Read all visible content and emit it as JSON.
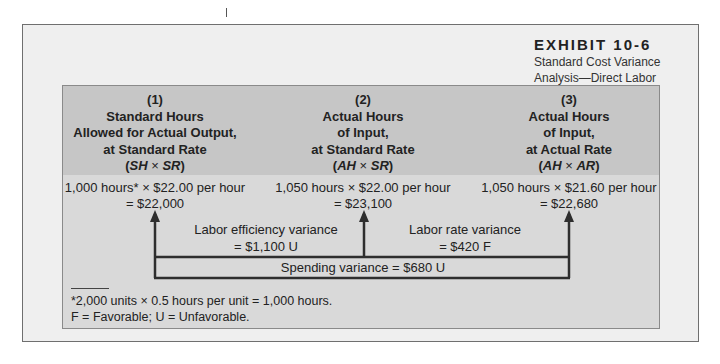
{
  "exhibit": {
    "title": "EXHIBIT 10-6",
    "subtitle_line1": "Standard Cost Variance",
    "subtitle_line2": "Analysis—Direct Labor"
  },
  "columns": [
    {
      "number": "(1)",
      "head_lines": [
        "Standard Hours",
        "Allowed for Actual Output,",
        "at Standard Rate"
      ],
      "formula_a": "SH",
      "formula_op": " × ",
      "formula_b": "SR",
      "calc_line1": "1,000 hours* × $22.00 per hour",
      "calc_line2": "= $22,000"
    },
    {
      "number": "(2)",
      "head_lines": [
        "Actual Hours",
        "of Input,",
        "at Standard Rate"
      ],
      "formula_a": "AH",
      "formula_op": " × ",
      "formula_b": "SR",
      "calc_line1": "1,050 hours × $22.00 per hour",
      "calc_line2": "= $23,100"
    },
    {
      "number": "(3)",
      "head_lines": [
        "Actual Hours",
        "of Input,",
        "at Actual Rate"
      ],
      "formula_a": "AH",
      "formula_op": " × ",
      "formula_b": "AR",
      "calc_line1": "1,050 hours × $21.60 per hour",
      "calc_line2": "= $22,680"
    }
  ],
  "variances": {
    "efficiency_label": "Labor efficiency variance",
    "efficiency_value": "= $1,100 U",
    "rate_label": "Labor rate variance",
    "rate_value": "= $420 F",
    "spending": "Spending variance = $680 U"
  },
  "footnotes": {
    "line1": "*2,000 units × 0.5 hours per unit = 1,000 hours.",
    "line2": "F = Favorable; U = Unfavorable."
  },
  "colors": {
    "outer_bg": "#efefef",
    "header_bg": "#c6c6c6",
    "body_bg": "#d9d9d9",
    "line": "#2e2e2e"
  }
}
